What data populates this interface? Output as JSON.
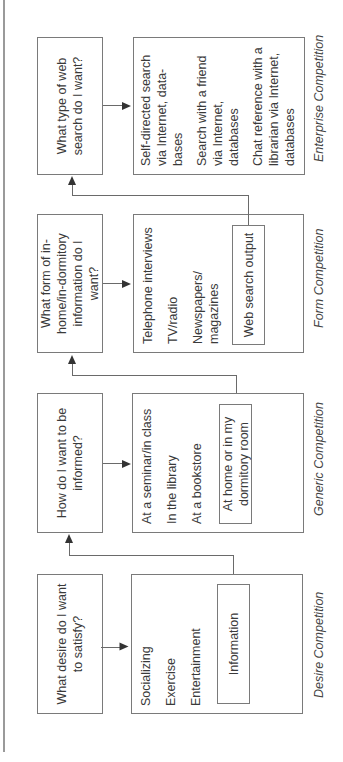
{
  "panels": [
    {
      "question": "What desire do I want to satisfy?",
      "options": [
        "Socializing",
        "Exercise",
        "Entertainment"
      ],
      "highlighted": "Information",
      "label": "Desire Competition"
    },
    {
      "question": "How do I want to be informed?",
      "options": [
        "At a seminar/in class",
        "In the library",
        "At a bookstore"
      ],
      "highlighted": "At home or in my dormitory room",
      "label": "Generic Competition"
    },
    {
      "question": "What form of in-home/in-dormitory information do I want?",
      "options": [
        "Telephone interviews",
        "TV/radio",
        "Newspapers/ magazines"
      ],
      "highlighted": "Web search output",
      "label": "Form Competition"
    },
    {
      "question": "What type of web search do I want?",
      "options": [
        "Self-directed search via Internet, data-bases",
        "Search with a friend via Internet, databases",
        "Chat reference with a librarian via Internet, databases"
      ],
      "highlighted": "",
      "label": "Enterprise Competition"
    }
  ],
  "colors": {
    "border": "#7a7a7a",
    "text": "#3a3a3a",
    "side_bar": "#9a9a9a"
  }
}
